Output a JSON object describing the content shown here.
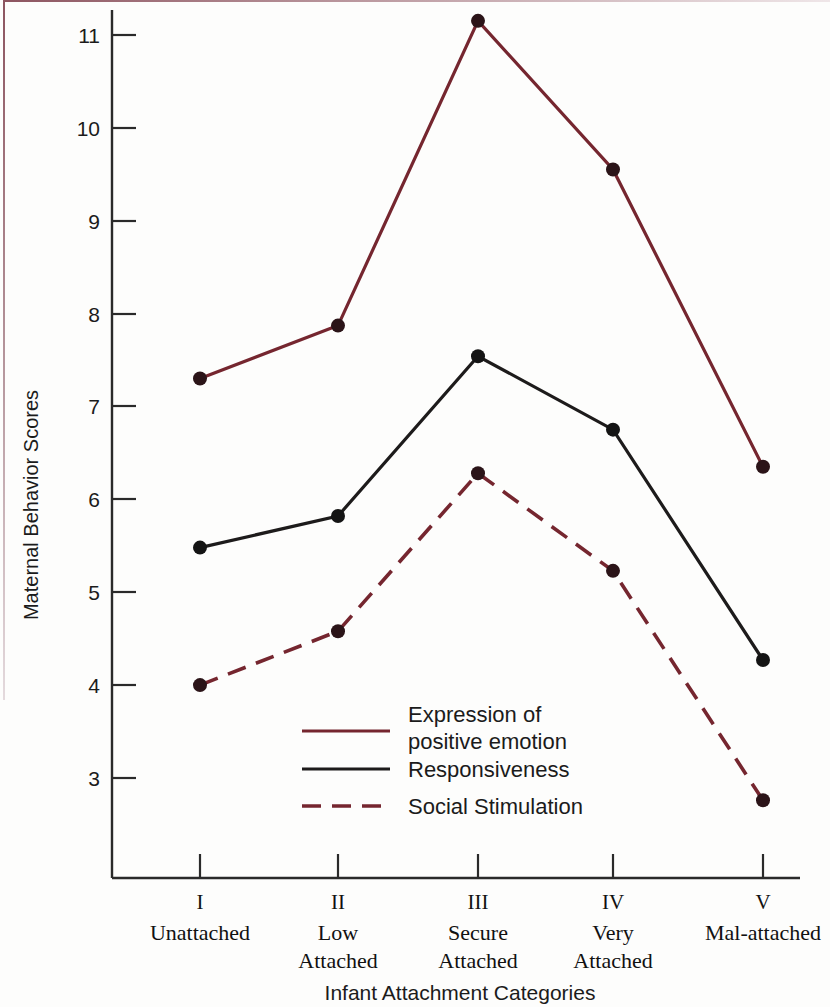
{
  "figure": {
    "y_axis_title": "Maternal Behavior Scores",
    "x_axis_title": "Infant Attachment Categories"
  },
  "chart_data": {
    "type": "line",
    "title": "",
    "xlabel": "Infant Attachment Categories",
    "ylabel": "Maternal Behavior Scores",
    "ylim": [
      2.5,
      11.4
    ],
    "yticks": [
      3,
      4,
      5,
      6,
      7,
      8,
      9,
      10,
      11
    ],
    "ytick_labels": [
      "3",
      "4",
      "5",
      "6",
      "7",
      "8",
      "9",
      "10",
      "11"
    ],
    "grid": false,
    "legend_position": "inside-lower-center",
    "categories": [
      "I",
      "II",
      "III",
      "IV",
      "V"
    ],
    "category_names": [
      "Unattached",
      "Low\nAttached",
      "Secure\nAttached",
      "Very\nAttached",
      "Mal-attached"
    ],
    "series": [
      {
        "name": "Expression of positive emotion",
        "legend_label_line1": "Expression of",
        "legend_label_line2": "positive emotion",
        "color": "#75262f",
        "style": "solid",
        "values": [
          7.3,
          7.87,
          11.15,
          9.55,
          6.35
        ]
      },
      {
        "name": "Responsiveness",
        "legend_label_line1": "Responsiveness",
        "legend_label_line2": "",
        "color": "#1d1b1b",
        "style": "solid",
        "values": [
          5.48,
          5.82,
          7.54,
          6.75,
          4.27
        ]
      },
      {
        "name": "Social Stimulation",
        "legend_label_line1": "Social Stimulation",
        "legend_label_line2": "",
        "color": "#75262f",
        "style": "dashed",
        "values": [
          4.0,
          4.58,
          6.28,
          5.23,
          2.76
        ]
      }
    ]
  },
  "ticks": {
    "y": [
      "11",
      "10",
      "9",
      "8",
      "7",
      "6",
      "5",
      "4",
      "3"
    ]
  },
  "categories": [
    {
      "roman": "I",
      "line1": "Unattached",
      "line2": ""
    },
    {
      "roman": "II",
      "line1": "Low",
      "line2": "Attached"
    },
    {
      "roman": "III",
      "line1": "Secure",
      "line2": "Attached"
    },
    {
      "roman": "IV",
      "line1": "Very",
      "line2": "Attached"
    },
    {
      "roman": "V",
      "line1": "Mal-attached",
      "line2": ""
    }
  ],
  "legend": [
    {
      "line1": "Expression of",
      "line2": "positive emotion"
    },
    {
      "line1": "Responsiveness",
      "line2": ""
    },
    {
      "line1": "Social Stimulation",
      "line2": ""
    }
  ]
}
